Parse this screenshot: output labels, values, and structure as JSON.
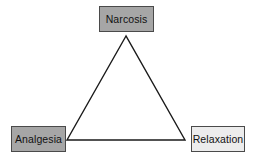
{
  "diagram": {
    "type": "triangle",
    "nodes": [
      {
        "id": "narcosis",
        "label": "Narcosis",
        "position": "top",
        "fill": "#a6a6a6"
      },
      {
        "id": "analgesia",
        "label": "Analgesia",
        "position": "bottom-left",
        "fill": "#a6a6a6"
      },
      {
        "id": "relaxation",
        "label": "Relaxation",
        "position": "bottom-right",
        "fill": "#ececec"
      }
    ],
    "edges": [
      {
        "from": "narcosis",
        "to": "analgesia"
      },
      {
        "from": "analgesia",
        "to": "relaxation"
      },
      {
        "from": "relaxation",
        "to": "narcosis"
      }
    ],
    "colors": {
      "stroke": "#1a1a1a",
      "border": "#4a4a4a",
      "background": "#ffffff"
    }
  }
}
